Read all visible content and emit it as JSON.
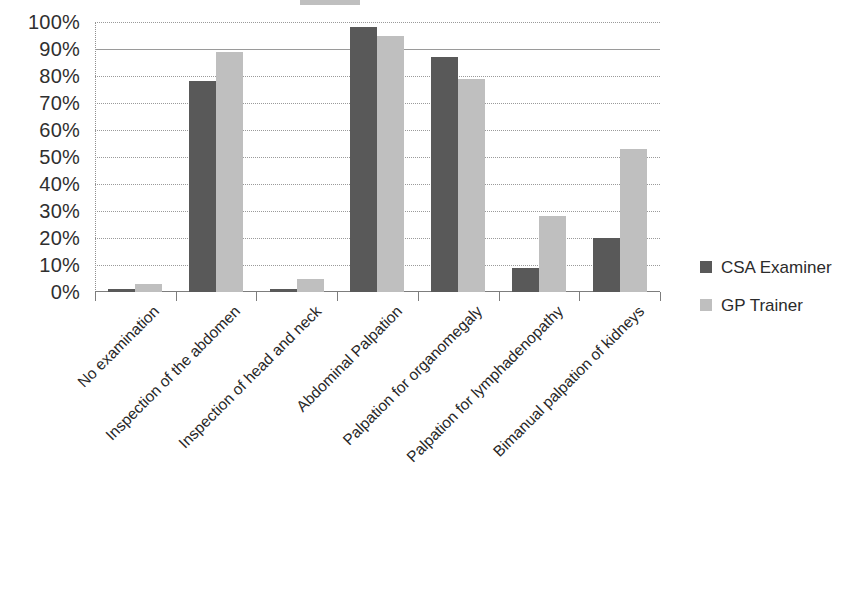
{
  "chart_data": {
    "type": "bar",
    "title": "",
    "xlabel": "",
    "ylabel": "",
    "ylim": [
      0,
      100
    ],
    "grid": true,
    "legend_position": "right",
    "categories": [
      "No examination",
      "Inspection of the abdomen",
      "Inspection of head and neck",
      "Abdominal Palpation",
      "Palpation for organomegaly",
      "Palpation for lymphadenopathy",
      "Bimanual palpation of kidneys"
    ],
    "ytick_labels": [
      "100%",
      "90%",
      "80%",
      "70%",
      "60%",
      "50%",
      "40%",
      "30%",
      "20%",
      "10%",
      "0%"
    ],
    "ytick_values": [
      100,
      90,
      80,
      70,
      60,
      50,
      40,
      30,
      20,
      10,
      0
    ],
    "series": [
      {
        "name": "CSA Examiner",
        "color": "#595959",
        "values": [
          1,
          78,
          1,
          98,
          87,
          9,
          20
        ]
      },
      {
        "name": "GP Trainer",
        "color": "#bfbfbf",
        "values": [
          3,
          89,
          5,
          95,
          79,
          28,
          53
        ]
      }
    ]
  },
  "legend": {
    "items": [
      {
        "label": "CSA Examiner",
        "swatch": "#595959"
      },
      {
        "label": "GP Trainer",
        "swatch": "#bfbfbf"
      }
    ]
  }
}
